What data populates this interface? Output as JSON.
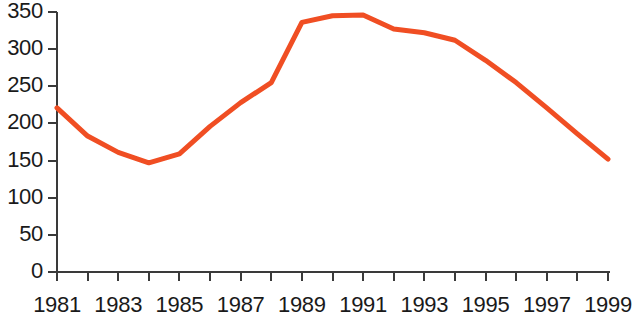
{
  "chart_data": {
    "type": "line",
    "title": "",
    "subtitle": "",
    "xlabel": "",
    "ylabel": "",
    "x": [
      1981,
      1982,
      1983,
      1984,
      1985,
      1986,
      1987,
      1988,
      1989,
      1990,
      1991,
      1992,
      1993,
      1994,
      1995,
      1996,
      1997,
      1998,
      1999
    ],
    "values": [
      221,
      183,
      161,
      147,
      159,
      196,
      228,
      255,
      336,
      345,
      346,
      327,
      322,
      312,
      285,
      255,
      221,
      186,
      152
    ],
    "series": [
      {
        "name": "",
        "color": "#F04E23",
        "values": [
          221,
          183,
          161,
          147,
          159,
          196,
          228,
          255,
          336,
          345,
          346,
          327,
          322,
          312,
          285,
          255,
          221,
          186,
          152
        ]
      }
    ],
    "xlim": [
      1981,
      1999
    ],
    "ylim": [
      0,
      350
    ],
    "x_tick_values": [
      1981,
      1982,
      1983,
      1984,
      1985,
      1986,
      1987,
      1988,
      1989,
      1990,
      1991,
      1992,
      1993,
      1994,
      1995,
      1996,
      1997,
      1998,
      1999
    ],
    "x_tick_labels": [
      "1981",
      "",
      "1983",
      "",
      "1985",
      "",
      "1987",
      "",
      "1989",
      "",
      "1991",
      "",
      "1993",
      "",
      "1995",
      "",
      "1997",
      "",
      "1999"
    ],
    "y_ticks": [
      0,
      50,
      100,
      150,
      200,
      250,
      300,
      350
    ],
    "y_tick_labels": [
      "0",
      "50",
      "100",
      "150",
      "200",
      "250",
      "300",
      "350"
    ],
    "grid": false,
    "legend": false,
    "legend_position": "none",
    "annotations": [],
    "axis_color": "#3a3a3a",
    "line_width": 5
  },
  "axes": {
    "y_labels": [
      "350",
      "300",
      "250",
      "200",
      "150",
      "100",
      "50",
      "0"
    ],
    "x_labels": [
      "1981",
      "1983",
      "1985",
      "1987",
      "1989",
      "1991",
      "1993",
      "1995",
      "1997",
      "1999"
    ]
  }
}
